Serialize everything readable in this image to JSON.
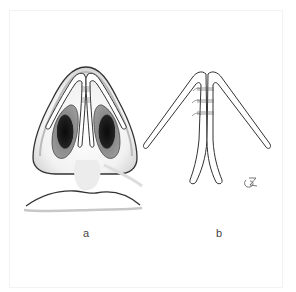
{
  "figure": {
    "panels": [
      {
        "id": "a",
        "label": "a",
        "description": "Basal view of nose showing lateral crura and medial crura with sutures"
      },
      {
        "id": "b",
        "label": "b",
        "description": "Isolated alar cartilages with medial crura sutured together"
      }
    ],
    "signature": "artist-monogram",
    "colors": {
      "line": "#333333",
      "nostril_dark": "#111111",
      "nostril_mid": "#8a8a8a",
      "shade": "#cfcfcf",
      "background": "#ffffff"
    }
  }
}
